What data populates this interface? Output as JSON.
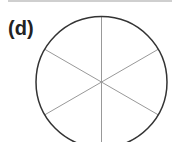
{
  "panel": {
    "label": "(d)",
    "shape": "circle divided into 6 equal sectors",
    "sectors": 6,
    "colors": {
      "circle": "#333333",
      "spokes": "#999999",
      "background": "#ffffff"
    }
  }
}
